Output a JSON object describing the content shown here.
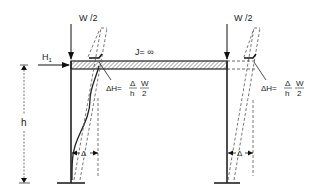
{
  "diagram": {
    "loads": {
      "left_vertical": "W /2",
      "right_vertical": "W /2",
      "horizontal": "H",
      "horizontal_subscript": "1"
    },
    "beam": {
      "stiffness_label": "J= ∞"
    },
    "dimensions": {
      "height": "h",
      "left_drift": "Δ",
      "right_drift": "Δ"
    },
    "formulas": {
      "left": {
        "lhs": "ΔH=",
        "frac1_num": "Δ",
        "frac1_den": "h",
        "frac2_num": "W",
        "frac2_den": "2"
      },
      "right": {
        "lhs": "ΔH=",
        "frac1_num": "Δ",
        "frac1_den": "h",
        "frac2_num": "W",
        "frac2_den": "2"
      }
    },
    "colors": {
      "line": "#222222",
      "dashed": "#555555",
      "hatch": "#333333",
      "background": "#ffffff"
    }
  }
}
